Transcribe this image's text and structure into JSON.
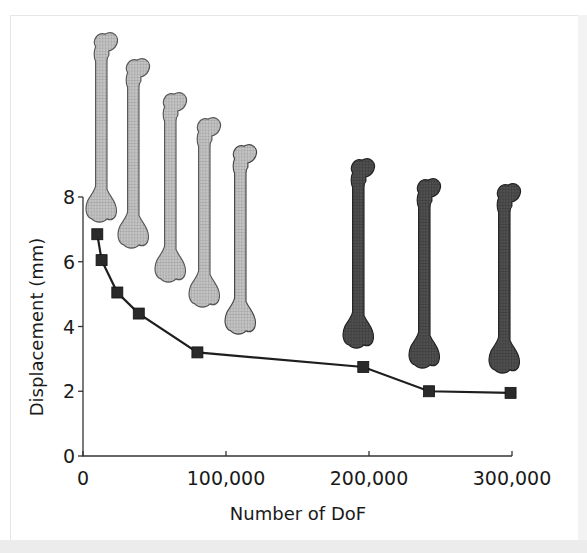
{
  "chart_data": {
    "type": "line",
    "title": "",
    "xlabel": "Number of DoF",
    "ylabel": "Displacement (mm)",
    "xlim": [
      0,
      300000
    ],
    "ylim": [
      0,
      8
    ],
    "x_ticks": [
      0,
      100000,
      200000,
      300000
    ],
    "x_tick_labels": [
      "0",
      "100,000",
      "200,000",
      "300,000"
    ],
    "y_ticks": [
      0,
      2,
      4,
      6,
      8
    ],
    "y_tick_labels": [
      "0",
      "2",
      "4",
      "6",
      "8"
    ],
    "grid": false,
    "legend": null,
    "marker": "square",
    "series": [
      {
        "name": "Displacement",
        "x": [
          10000,
          13000,
          24000,
          39000,
          80000,
          196000,
          242000,
          299000
        ],
        "y": [
          6.85,
          6.05,
          5.05,
          4.4,
          3.2,
          2.75,
          2.0,
          1.95
        ]
      }
    ],
    "annotations": [
      "Femur mesh illustrations above data points, light grey for coarse meshes (5) and dark grey for fine meshes (3)"
    ]
  },
  "colors": {
    "line": "#1e1e1e",
    "marker": "#2a2a2a",
    "bone_coarse": "#b5b5b5",
    "bone_fine": "#4a4a4a",
    "axis": "#333333"
  }
}
